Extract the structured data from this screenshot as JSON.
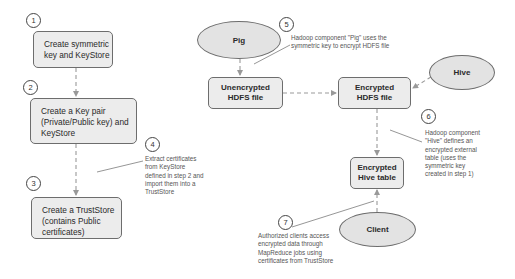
{
  "steps": {
    "s1": "1",
    "s2": "2",
    "s3": "3",
    "s4": "4",
    "s5": "5",
    "s6": "6",
    "s7": "7"
  },
  "boxes": {
    "symmetric_key": "Create symmetric\nkey and KeyStore",
    "key_pair": "Create a Key pair\n(Private/Public key) and\nKeyStore",
    "truststore": "Create a TrustStore\n(contains Public\ncertificates)",
    "unencrypted_hdfs": "Unencrypted\nHDFS file",
    "encrypted_hdfs": "Encrypted\nHDFS file",
    "encrypted_hive_table": "Encrypted\nHive table"
  },
  "actors": {
    "pig": "Pig",
    "hive": "Hive",
    "client": "Client"
  },
  "notes": {
    "n4": "Extract certificates\nfrom KeyStore\ndefined in step 2 and\nimport them into a\nTrustStore",
    "n5": "Hadoop component \"Pig\" uses the\nsymmetric key to encrypt HDFS file",
    "n6": "Hadoop component\n\"Hive\" defines an\nencrypted external\ntable (uses the\nsymmetric key\ncreated in step 1)",
    "n7": "Authorized clients access\nencrypted data through\nMapReduce jobs using\ncertificates from TrustStore"
  },
  "colors": {
    "box_fill": "#ececec",
    "ellipse_fill": "#e3e3e3",
    "border": "#6d6d6d",
    "connector": "#9a9a9a"
  }
}
